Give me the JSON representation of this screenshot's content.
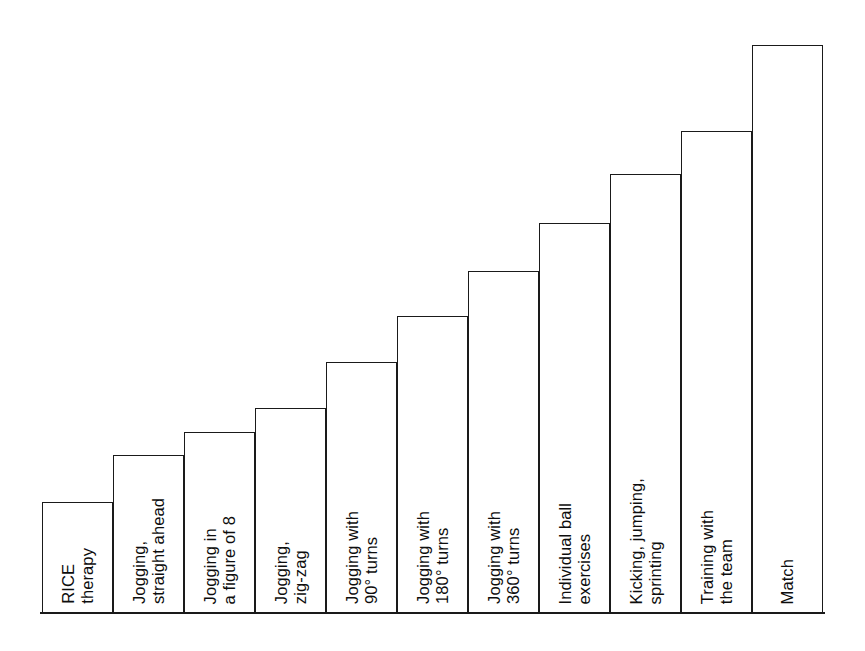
{
  "chart_data": {
    "type": "bar",
    "title": "",
    "subtitle": "",
    "xlabel": "",
    "ylabel": "",
    "grid": false,
    "legend": null,
    "orientation": "vertical",
    "axis_note": "Unlabeled ordinal y-axis: increasing intensity / progression of rehabilitation stages",
    "categories": [
      "RICE\ntherapy",
      "Jogging,\nstraight ahead",
      "Jogging in\na figure of 8",
      "Jogging,\nzig-zag",
      "Jogging with\n90° turns",
      "Jogging with\n180° turns",
      "Jogging with\n360° turns",
      "Individual ball\nexercises",
      "Kicking, jumping,\nsprinting",
      "Training with\nthe team",
      "Match"
    ],
    "values": [
      1,
      2,
      3,
      4,
      5,
      6,
      7,
      8,
      9,
      10,
      11
    ],
    "bar_heights_px": [
      111,
      158,
      181,
      205,
      251,
      297,
      342,
      390,
      439,
      482,
      568
    ],
    "ylim": [
      0,
      11
    ]
  },
  "style": {
    "bar_stroke": "#1a1a1a",
    "bar_fill": "#ffffff",
    "background": "#ffffff",
    "text_color": "#0d0d0d"
  },
  "geometry": {
    "baseline_y": 613,
    "bar_left_x": [
      42,
      113,
      184,
      255,
      326,
      397,
      468,
      539,
      610,
      681,
      752
    ],
    "bar_width": 71,
    "bar_top_y": [
      502,
      455,
      432,
      408,
      362,
      316,
      271,
      223,
      174,
      131,
      45
    ]
  }
}
